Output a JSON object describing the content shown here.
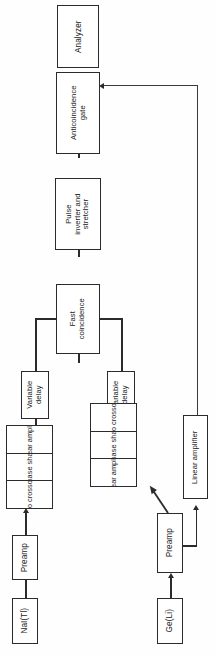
{
  "figure": {
    "orientation": "rotated-90-ccw",
    "type": "block-diagram",
    "colors": {
      "line": "#2b2b2b",
      "box_fill": "#ffffff",
      "background": "#fefefe",
      "text": "#1b1b1b"
    }
  },
  "blocks": {
    "analyzer": {
      "label": "Analyzer"
    },
    "anticoincidence_gate": {
      "label": "Anticoincidence\ngate"
    },
    "pulse_inverter": {
      "label": "Pulse\ninverter and\nstretcher"
    },
    "fast_coincidence": {
      "label": "Fast\ncoincidence"
    },
    "variable_delay_left": {
      "label": "Variable\ndelay"
    },
    "variable_delay_right": {
      "label": "Variable\ndelay"
    },
    "preamp_nai": {
      "label": "Preamp"
    },
    "preamp_ge": {
      "label": "Preamp"
    },
    "detector_nai": {
      "label": "NaI(Tl)"
    },
    "detector_ge": {
      "label": "Ge(Li)"
    },
    "linear_amplifier_ge": {
      "label": "Linear amplifier"
    }
  },
  "chains": {
    "nai_chain": {
      "cells": [
        {
          "label": "Linear amplifier"
        },
        {
          "label": "Biphase shaper"
        },
        {
          "label": "Zero crossover"
        }
      ]
    },
    "ge_chain": {
      "cells": [
        {
          "label": "Zero crossover"
        },
        {
          "label": "Biphase shaper"
        },
        {
          "label": "Linear amplifier"
        }
      ]
    }
  },
  "signs": {
    "inverter_output_minus": "−",
    "inverter_input_plus": "+"
  },
  "connections": [
    {
      "from": "anticoincidence_gate",
      "to": "analyzer"
    },
    {
      "from": "pulse_inverter",
      "to": "anticoincidence_gate",
      "sign": "−"
    },
    {
      "from": "fast_coincidence",
      "to": "pulse_inverter",
      "sign": "+"
    },
    {
      "from": "variable_delay_left",
      "to": "fast_coincidence"
    },
    {
      "from": "variable_delay_right",
      "to": "fast_coincidence"
    },
    {
      "from": "nai_chain",
      "to": "variable_delay_left"
    },
    {
      "from": "ge_chain",
      "to": "variable_delay_right"
    },
    {
      "from": "preamp_nai",
      "to": "nai_chain"
    },
    {
      "from": "detector_nai",
      "to": "preamp_nai"
    },
    {
      "from": "preamp_ge",
      "to": "ge_chain"
    },
    {
      "from": "preamp_ge",
      "to": "linear_amplifier_ge"
    },
    {
      "from": "detector_ge",
      "to": "preamp_ge"
    },
    {
      "from": "linear_amplifier_ge",
      "to": "analyzer"
    }
  ]
}
